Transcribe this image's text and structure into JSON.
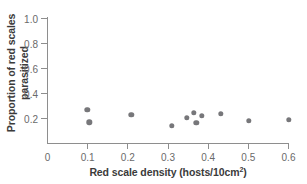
{
  "chart_data": {
    "type": "scatter",
    "title": "",
    "xlabel": "Red scale density (hosts/10cm2)",
    "xlabel_base": "Red scale density (hosts/10cm",
    "xlabel_superscript": "2",
    "xlabel_tail": ")",
    "ylabel_line1": "Proportion of red scales",
    "ylabel_line2": "parasitized",
    "xlim": [
      0,
      0.62
    ],
    "ylim": [
      0,
      1.0
    ],
    "xticks": [
      0,
      0.1,
      0.2,
      0.3,
      0.4,
      0.5,
      0.6
    ],
    "xtick_labels": [
      "0",
      "0.1",
      "0.2",
      "0.3",
      "0.4",
      "0.5",
      "0.6"
    ],
    "yticks": [
      0.2,
      0.4,
      0.6,
      0.8,
      1.0
    ],
    "ytick_labels": [
      "0.2",
      "0.4",
      "0.6",
      "0.8",
      "1.0"
    ],
    "grid": false,
    "legend": null,
    "marker": "filled-circle",
    "marker_color": "#77777a",
    "axis_color": "#8e8e8e",
    "points": [
      {
        "x": 0.1,
        "y": 0.265
      },
      {
        "x": 0.105,
        "y": 0.165
      },
      {
        "x": 0.21,
        "y": 0.225
      },
      {
        "x": 0.31,
        "y": 0.135
      },
      {
        "x": 0.348,
        "y": 0.2
      },
      {
        "x": 0.365,
        "y": 0.24
      },
      {
        "x": 0.372,
        "y": 0.163
      },
      {
        "x": 0.385,
        "y": 0.215
      },
      {
        "x": 0.432,
        "y": 0.232
      },
      {
        "x": 0.503,
        "y": 0.175
      },
      {
        "x": 0.602,
        "y": 0.185
      }
    ]
  }
}
